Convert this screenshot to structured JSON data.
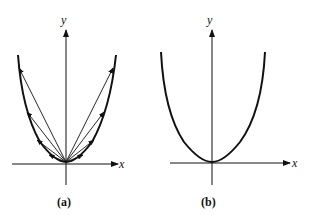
{
  "panels": [
    {
      "id": "a",
      "caption": "(a)",
      "x_label": "x",
      "y_label": "y",
      "description": "Parabola y = x^2 with position vectors drawn from the origin to points on the curve"
    },
    {
      "id": "b",
      "caption": "(b)",
      "x_label": "x",
      "y_label": "y",
      "description": "Parabola y = x^2"
    }
  ],
  "colors": {
    "ink": "#111111",
    "background": "#ffffff"
  }
}
